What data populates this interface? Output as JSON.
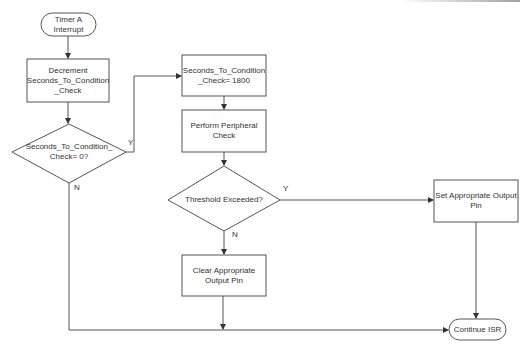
{
  "diagram": {
    "type": "flowchart",
    "colors": {
      "stroke": "#555555",
      "text": "#333333",
      "background": "#ffffff"
    },
    "nodes": {
      "start": {
        "shape": "terminator",
        "label": "Timer A\nInterrupt"
      },
      "decrement": {
        "shape": "process",
        "label": "Decrement\nSeconds_To_Condition\n_Check"
      },
      "check_zero": {
        "shape": "decision",
        "label": "Seconds_To_Condition_\nCheck= 0?"
      },
      "reset_counter": {
        "shape": "process",
        "label": "Seconds_To_Condition\n_Check= 1800"
      },
      "peripheral_check": {
        "shape": "process",
        "label": "Perform Peripheral\nCheck"
      },
      "threshold": {
        "shape": "decision",
        "label": "Threshold Exceeded?"
      },
      "clear_pin": {
        "shape": "process",
        "label": "Clear Appropriate\nOutput Pin"
      },
      "set_pin": {
        "shape": "process",
        "label": "Set Appropriate Output\nPin"
      },
      "end": {
        "shape": "terminator",
        "label": "Continue ISR"
      }
    },
    "edges": [
      {
        "from": "start",
        "to": "decrement",
        "label": ""
      },
      {
        "from": "decrement",
        "to": "check_zero",
        "label": ""
      },
      {
        "from": "check_zero",
        "to": "reset_counter",
        "label": "Y"
      },
      {
        "from": "check_zero",
        "to": "end",
        "label": "N"
      },
      {
        "from": "reset_counter",
        "to": "peripheral_check",
        "label": ""
      },
      {
        "from": "peripheral_check",
        "to": "threshold",
        "label": ""
      },
      {
        "from": "threshold",
        "to": "set_pin",
        "label": "Y"
      },
      {
        "from": "threshold",
        "to": "clear_pin",
        "label": "N"
      },
      {
        "from": "clear_pin",
        "to": "end",
        "label": ""
      },
      {
        "from": "set_pin",
        "to": "end",
        "label": ""
      }
    ],
    "edge_labels": {
      "check_zero_yes": "Y",
      "check_zero_no": "N",
      "threshold_yes": "Y",
      "threshold_no": "N"
    }
  }
}
